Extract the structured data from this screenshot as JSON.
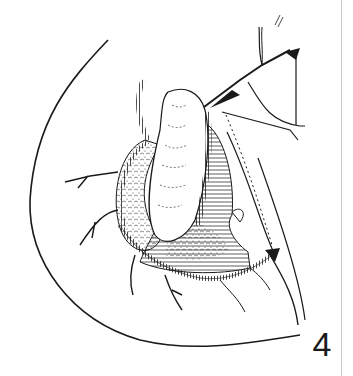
{
  "figure": {
    "label": "4",
    "colors": {
      "ink": "#1a1a1a",
      "background": "#ffffff",
      "edge": "#c8c8c8"
    }
  }
}
